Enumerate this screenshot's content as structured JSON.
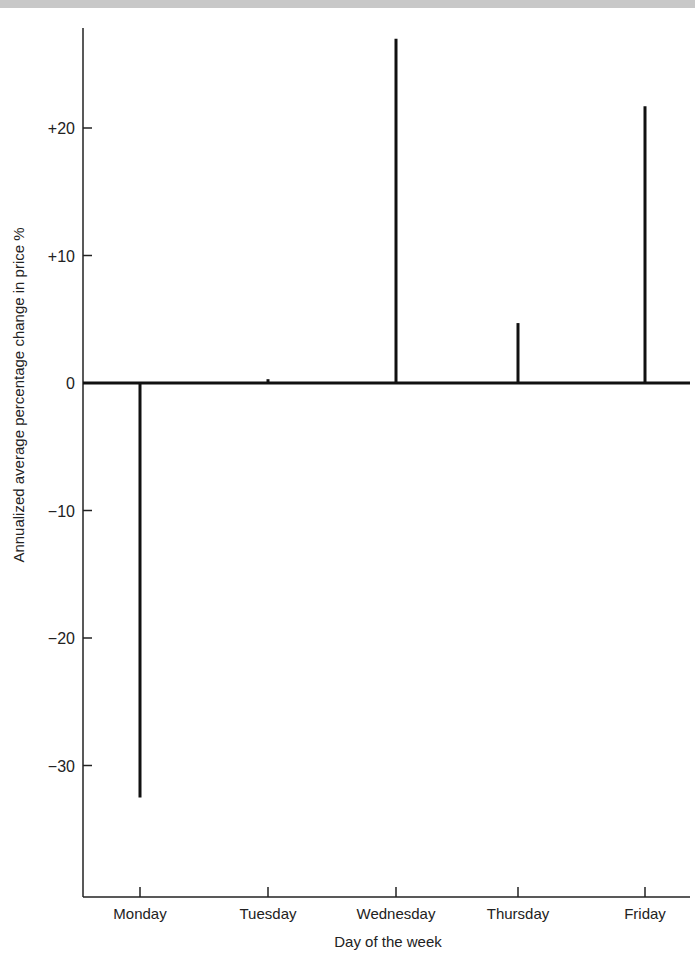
{
  "chart_data": {
    "type": "bar",
    "title": "",
    "xlabel": "Day of the week",
    "ylabel": "Annualized average percentage change in price %",
    "categories": [
      "Monday",
      "Tuesday",
      "Wednesday",
      "Thursday",
      "Friday"
    ],
    "values": [
      -32.5,
      0.3,
      27.0,
      4.7,
      21.7
    ],
    "ylim": [
      -40,
      28
    ],
    "yticks": [
      20,
      10,
      0,
      -10,
      -20,
      -30
    ],
    "ytick_labels": [
      "+20",
      "+10",
      "0",
      "−10",
      "−20",
      "−30"
    ],
    "grid": false,
    "legend": null
  }
}
